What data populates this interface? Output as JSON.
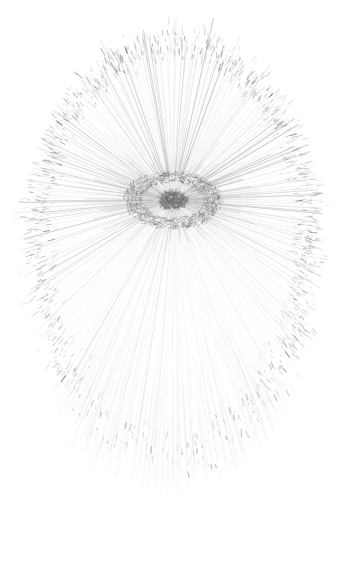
{
  "artwork": {
    "title": "Radial Burst Eye",
    "medium": "generative line drawing",
    "palette": {
      "background": "#ffffff",
      "ray_color": "#8a8a8a",
      "ray_color_faint": "#c9c9c9",
      "band_color": "#9a9a9a",
      "core_color": "#6a6a6a",
      "core_dark": "#5a5a5a"
    },
    "canvas": {
      "width": 345,
      "height": 587
    },
    "center": {
      "x": 173,
      "y": 200,
      "label": "radial origin / eye pupil"
    },
    "core": {
      "pupil_rx": 14,
      "pupil_ry": 9,
      "iris_rx": 44,
      "iris_ry": 26,
      "label": "eye-like hub"
    },
    "rays": {
      "count": 260,
      "description": "thin gray lines radiating from the central hub to an ovoid boundary",
      "min_opacity": 0.1,
      "max_opacity": 0.62,
      "stroke_width_min": 0.35,
      "stroke_width_max": 0.95
    },
    "boundary": {
      "shape": "ovoid",
      "description": "egg-shaped dense band of scribbled texture where the rays terminate",
      "radius_x": 142,
      "radius_y_up": 165,
      "radius_y_down": 268,
      "top_y": 38,
      "bottom_y": 545,
      "left_x": 31,
      "right_x": 316
    },
    "texture": {
      "clumps": 1500,
      "description": "short dark dashes clustered along the ovoid band, densest at top apex and lower band"
    },
    "features": [
      {
        "name": "top-apex-cluster",
        "x": 175,
        "y": 62,
        "note": "dense scribbled crown"
      },
      {
        "name": "left-band-cluster",
        "x": 52,
        "y": 260,
        "note": "textured left flank"
      },
      {
        "name": "right-band-cluster",
        "x": 298,
        "y": 255,
        "note": "textured right flank"
      },
      {
        "name": "lower-band-cluster",
        "x": 170,
        "y": 450,
        "note": "broad dense lower band"
      },
      {
        "name": "ray-tail-fade",
        "x": 175,
        "y": 535,
        "note": "rays fade to white at bottom"
      }
    ]
  }
}
